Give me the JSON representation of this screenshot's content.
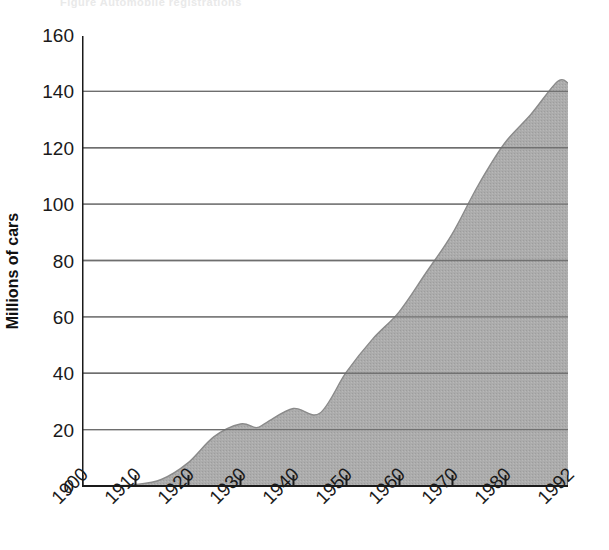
{
  "figure": {
    "header_remnant": "Figure  Automobile registrations"
  },
  "chart_data": {
    "type": "area",
    "title": "",
    "xlabel": "",
    "ylabel": "Millions of cars",
    "xlim": [
      1900,
      1992
    ],
    "ylim": [
      0,
      160
    ],
    "grid": true,
    "legend": "none",
    "fill_color": "#aaaaaa",
    "line_color": "#8f8f8f",
    "axis_color": "#1a1a1a",
    "gridline_color": "#777777",
    "x_tick_labels": [
      "1900",
      "1910",
      "1920",
      "1930",
      "1940",
      "1950",
      "1960",
      "1970",
      "1980",
      "1992"
    ],
    "x_tick_values": [
      1900,
      1910,
      1920,
      1930,
      1940,
      1950,
      1960,
      1970,
      1980,
      1992
    ],
    "y_tick_labels": [
      "160",
      "140",
      "120",
      "100",
      "80",
      "60",
      "40",
      "20",
      "0"
    ],
    "y_tick_values": [
      160,
      140,
      120,
      100,
      80,
      60,
      40,
      20,
      0
    ],
    "x": [
      1900,
      1905,
      1910,
      1915,
      1920,
      1925,
      1930,
      1933,
      1935,
      1940,
      1945,
      1950,
      1955,
      1960,
      1965,
      1970,
      1975,
      1980,
      1985,
      1990,
      1992
    ],
    "values": [
      0,
      0.1,
      0.5,
      2.3,
      8.1,
      17.5,
      22.0,
      20.7,
      22.6,
      27.5,
      25.8,
      40.3,
      52.1,
      61.7,
      75.3,
      89.2,
      106.7,
      121.6,
      131.9,
      143.5,
      143.0
    ],
    "series": [
      {
        "name": "Millions of cars",
        "values": [
          0,
          0.1,
          0.5,
          2.3,
          8.1,
          17.5,
          22.0,
          20.7,
          22.6,
          27.5,
          25.8,
          40.3,
          52.1,
          61.7,
          75.3,
          89.2,
          106.7,
          121.6,
          131.9,
          143.5,
          143.0
        ]
      }
    ]
  }
}
